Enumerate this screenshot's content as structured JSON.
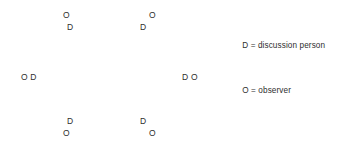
{
  "diagram": {
    "background_color": "#ffffff",
    "text_color": "#2e2e2e",
    "width": 344,
    "height": 158,
    "markers": [
      {
        "id": "top-left-observer",
        "text": "O",
        "x": 63,
        "y": 11,
        "role": "observer"
      },
      {
        "id": "top-left-discussant",
        "text": "D",
        "x": 67,
        "y": 23,
        "role": "discussion person"
      },
      {
        "id": "top-right-observer",
        "text": "O",
        "x": 149,
        "y": 11,
        "role": "observer"
      },
      {
        "id": "top-right-discussant",
        "text": "D",
        "x": 140,
        "y": 23,
        "role": "discussion person"
      },
      {
        "id": "left-pair",
        "text": "O D",
        "x": 21,
        "y": 73,
        "role": "observer and discussion person"
      },
      {
        "id": "right-pair",
        "text": "D O",
        "x": 182,
        "y": 73,
        "role": "discussion person and observer"
      },
      {
        "id": "bottom-left-discussant",
        "text": "D",
        "x": 67,
        "y": 117,
        "role": "discussion person"
      },
      {
        "id": "bottom-left-observer",
        "text": "O",
        "x": 63,
        "y": 129,
        "role": "observer"
      },
      {
        "id": "bottom-right-discussant",
        "text": "D",
        "x": 140,
        "y": 117,
        "role": "discussion person"
      },
      {
        "id": "bottom-right-observer",
        "text": "O",
        "x": 149,
        "y": 129,
        "role": "observer"
      }
    ],
    "legend": {
      "items": [
        {
          "key": "D",
          "separator": "=",
          "description": "discussion person",
          "full": "D = discussion person"
        },
        {
          "key": "O",
          "separator": "=",
          "description": "observer",
          "full": "O = observer"
        }
      ]
    }
  }
}
